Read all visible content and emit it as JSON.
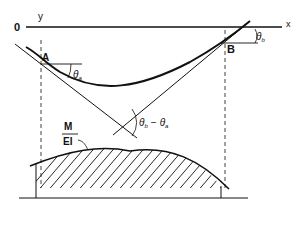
{
  "diagram": {
    "axes": {
      "origin_label": "0",
      "x_label": "x",
      "y_label": "y"
    },
    "points": {
      "a_label": "A",
      "b_label": "B"
    },
    "angles": {
      "theta_a": "θ",
      "theta_a_sub": "a",
      "theta_b": "θ",
      "theta_b_sub": "b",
      "diff_theta_b": "θ",
      "diff_b_sub": "b",
      "diff_minus": "−",
      "diff_theta_a": "θ",
      "diff_a_sub": "a"
    },
    "moment_diagram": {
      "numerator": "M",
      "denominator": "EI"
    },
    "colors": {
      "ink": "#111111",
      "background": "#ffffff"
    }
  }
}
